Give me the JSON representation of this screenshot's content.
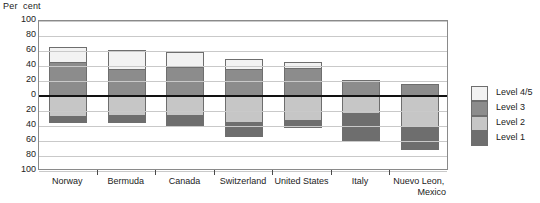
{
  "chart_data": {
    "type": "bar",
    "subtype": "diverging-stacked-bar",
    "title": "",
    "ylabel": "Per cent",
    "xlabel": "",
    "ylim": [
      -100,
      100
    ],
    "y_tick_values": [
      100,
      80,
      60,
      40,
      20,
      0,
      -20,
      -40,
      -60,
      -80,
      -100
    ],
    "y_tick_labels": [
      "100",
      "80",
      "60",
      "40",
      "20",
      "0",
      "20",
      "40",
      "60",
      "80",
      "100"
    ],
    "grid": true,
    "legend_position": "right",
    "categories": [
      "Norway",
      "Bermuda",
      "Canada",
      "Switzerland",
      "United States",
      "Italy",
      "Nuevo Leon, Mexico"
    ],
    "category_lines": [
      [
        "Norway"
      ],
      [
        "Bermuda"
      ],
      [
        "Canada"
      ],
      [
        "Switzerland"
      ],
      [
        "United States"
      ],
      [
        "Italy"
      ],
      [
        "Nuevo Leon,",
        "Mexico"
      ]
    ],
    "series": [
      {
        "name": "Level 4/5",
        "color": "#f2f2f2",
        "direction": "positive",
        "values": [
          20,
          26,
          20,
          13,
          8,
          0,
          0
        ]
      },
      {
        "name": "Level 3",
        "color": "#8c8c8c",
        "direction": "positive",
        "values": [
          46,
          36,
          39,
          36,
          37,
          22,
          16
        ]
      },
      {
        "name": "Level 2",
        "color": "#c6c6c6",
        "direction": "negative",
        "values": [
          -27,
          -25,
          -25,
          -35,
          -32,
          -23,
          -40
        ]
      },
      {
        "name": "Level 1",
        "color": "#6e6e6e",
        "direction": "negative",
        "values": [
          -7,
          -10,
          -15,
          -18,
          -9,
          -35,
          -30
        ]
      }
    ]
  },
  "legend": {
    "items": [
      {
        "label": "Level 4/5",
        "color": "#f2f2f2"
      },
      {
        "label": "Level 3",
        "color": "#8c8c8c"
      },
      {
        "label": "Level 2",
        "color": "#c6c6c6"
      },
      {
        "label": "Level 1",
        "color": "#6e6e6e"
      }
    ]
  },
  "axis": {
    "y_title": "Per  cent"
  },
  "colors": {
    "level45": "#f2f2f2",
    "level3": "#8c8c8c",
    "level2": "#c6c6c6",
    "level1": "#6e6e6e",
    "gridline": "#c9c9c9",
    "zeroline": "#121212",
    "frame": "#8a8a8a",
    "text": "#222222"
  }
}
